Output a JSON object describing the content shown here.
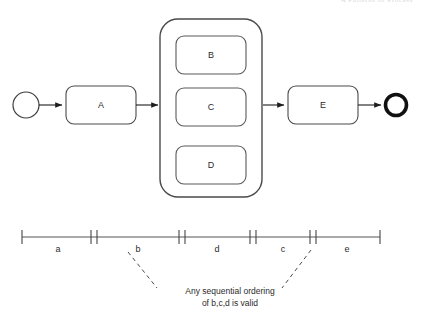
{
  "header": {
    "cropped_text": "A Patterns of  Process"
  },
  "diagram": {
    "title": "",
    "type": "bpmn-process-with-timeline",
    "stroke_color": "#3c3c3c",
    "text_color": "#2b2b2b",
    "events": [
      {
        "name": "start-event",
        "label": "",
        "cx": 26,
        "cy": 105,
        "r": 13,
        "stroke_width": 1.2
      },
      {
        "name": "end-event",
        "label": "",
        "cx": 396,
        "cy": 105,
        "r": 12,
        "stroke_width": 3.6
      }
    ],
    "tasks": [
      {
        "id": "A",
        "label": "A",
        "x": 66,
        "y": 86,
        "w": 70,
        "h": 38
      },
      {
        "id": "B",
        "label": "B",
        "x": 176,
        "y": 36,
        "w": 70,
        "h": 38
      },
      {
        "id": "C",
        "label": "C",
        "x": 176,
        "y": 88,
        "w": 70,
        "h": 38
      },
      {
        "id": "D",
        "label": "D",
        "x": 176,
        "y": 146,
        "w": 70,
        "h": 38
      },
      {
        "id": "E",
        "label": "E",
        "x": 288,
        "y": 86,
        "w": 70,
        "h": 38
      }
    ],
    "subprocess": {
      "name": "subprocess-container",
      "label": "",
      "x": 160,
      "y": 19,
      "w": 102,
      "h": 178
    },
    "flows": [
      {
        "from": "start-event",
        "to": "A"
      },
      {
        "from": "A",
        "to": "subprocess-container"
      },
      {
        "from": "subprocess-container",
        "to": "E"
      },
      {
        "from": "E",
        "to": "end-event"
      }
    ]
  },
  "timeline": {
    "name": "execution-timeline",
    "y": 237,
    "x_start": 22,
    "x_end": 380,
    "boundaries": [
      22,
      94,
      182,
      253,
      313,
      380
    ],
    "double_tick_boundaries": [
      94,
      182,
      253,
      313
    ],
    "segments": [
      {
        "label": "a",
        "start": 22,
        "end": 94
      },
      {
        "label": "b",
        "start": 94,
        "end": 182
      },
      {
        "label": "d",
        "start": 182,
        "end": 253
      },
      {
        "label": "c",
        "start": 253,
        "end": 313
      },
      {
        "label": "e",
        "start": 313,
        "end": 380
      }
    ]
  },
  "annotation": {
    "name": "ordering-note",
    "line1": "Any sequential ordering",
    "line2": "of b,c,d is valid",
    "center_x": 230,
    "line1_y": 294,
    "line2_y": 306,
    "leaders": [
      {
        "x1": 128,
        "y1": 252,
        "x2": 157,
        "y2": 288
      },
      {
        "x1": 311,
        "y1": 250,
        "x2": 282,
        "y2": 288
      }
    ]
  }
}
